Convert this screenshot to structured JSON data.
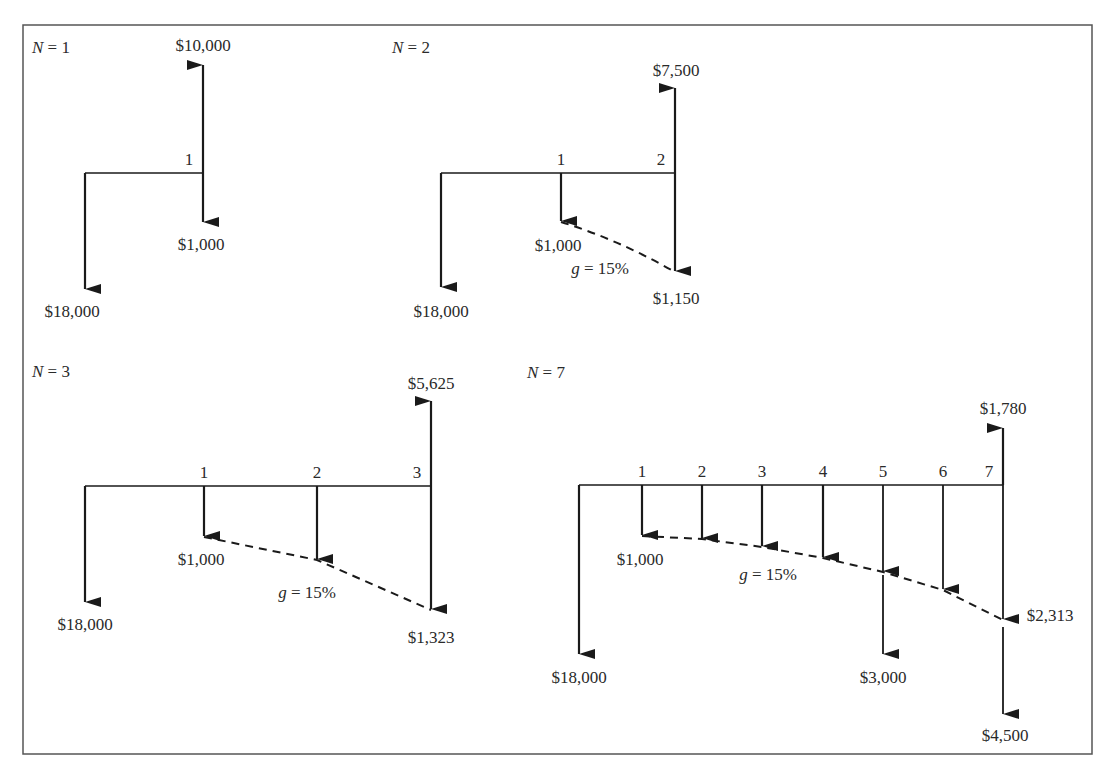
{
  "figure": {
    "frame": {
      "x": 23,
      "y": 25,
      "width": 1069,
      "height": 729
    },
    "colors": {
      "line": "#1a1a1a",
      "text": "#2a2a2a",
      "frame": "#555555",
      "background": "#ffffff"
    },
    "panels": [
      {
        "id": "n1",
        "title_var": "N",
        "title_rest": " = 1",
        "title_pos": [
          32,
          53
        ],
        "timeline_y": 173,
        "start_x": 85,
        "period_x": [
          203
        ],
        "period_labels": [
          "1"
        ],
        "initial_outflow": {
          "label": "$18,000",
          "tip_y": 290,
          "label_pos": [
            72,
            317
          ]
        },
        "outflows": [
          {
            "period": 1,
            "label": "$1,000",
            "tip_y": 223,
            "label_pos": [
              201,
              250
            ]
          }
        ],
        "inflows": [
          {
            "period": 1,
            "label": "$10,000",
            "tip_y": 64,
            "label_pos": [
              203,
              51
            ]
          }
        ],
        "extra_outflows": [],
        "growth": null
      },
      {
        "id": "n2",
        "title_var": "N",
        "title_rest": " = 2",
        "title_pos": [
          392,
          53
        ],
        "timeline_y": 173,
        "start_x": 441,
        "period_x": [
          561,
          675
        ],
        "period_labels": [
          "1",
          "2"
        ],
        "initial_outflow": {
          "label": "$18,000",
          "tip_y": 288,
          "label_pos": [
            441,
            317
          ]
        },
        "outflows": [
          {
            "period": 1,
            "label": "$1,000",
            "tip_y": 222,
            "label_pos": [
              558,
              251
            ]
          },
          {
            "period": 2,
            "label": "$1,150",
            "tip_y": 272,
            "label_pos": [
              676,
              304
            ]
          }
        ],
        "inflows": [
          {
            "period": 2,
            "label": "$7,500",
            "tip_y": 87,
            "label_pos": [
              676,
              76
            ]
          }
        ],
        "extra_outflows": [],
        "growth": {
          "var": "g",
          "rest": " = 15%",
          "label_pos": [
            600,
            274
          ]
        }
      },
      {
        "id": "n3",
        "title_var": "N",
        "title_rest": " = 3",
        "title_pos": [
          32,
          377
        ],
        "timeline_y": 486,
        "start_x": 85,
        "period_x": [
          204,
          317,
          431
        ],
        "period_labels": [
          "1",
          "2",
          "3"
        ],
        "initial_outflow": {
          "label": "$18,000",
          "tip_y": 603,
          "label_pos": [
            85,
            630
          ]
        },
        "outflows": [
          {
            "period": 1,
            "label": "$1,000",
            "tip_y": 537,
            "label_pos": [
              201,
              565
            ]
          },
          {
            "period": 2,
            "label": "",
            "tip_y": 560,
            "label_pos": [
              0,
              0
            ]
          },
          {
            "period": 3,
            "label": "$1,323",
            "tip_y": 610,
            "label_pos": [
              431,
              643
            ]
          }
        ],
        "inflows": [
          {
            "period": 3,
            "label": "$5,625",
            "tip_y": 400,
            "label_pos": [
              431,
              389
            ]
          }
        ],
        "extra_outflows": [],
        "growth": {
          "var": "g",
          "rest": " = 15%",
          "label_pos": [
            307,
            598
          ]
        }
      },
      {
        "id": "n7",
        "title_var": "N",
        "title_rest": " = 7",
        "title_pos": [
          527,
          378
        ],
        "timeline_y": 485,
        "start_x": 579,
        "period_x": [
          642,
          702,
          762,
          823,
          883,
          943,
          1003
        ],
        "period_labels": [
          "1",
          "2",
          "3",
          "4",
          "5",
          "6",
          "7"
        ],
        "initial_outflow": {
          "label": "$18,000",
          "tip_y": 655,
          "label_pos": [
            579,
            683
          ]
        },
        "outflows": [
          {
            "period": 1,
            "label": "$1,000",
            "tip_y": 536,
            "label_pos": [
              640,
              565
            ]
          },
          {
            "period": 2,
            "label": "",
            "tip_y": 539,
            "label_pos": [
              0,
              0
            ]
          },
          {
            "period": 3,
            "label": "",
            "tip_y": 547,
            "label_pos": [
              0,
              0
            ]
          },
          {
            "period": 4,
            "label": "",
            "tip_y": 558,
            "label_pos": [
              0,
              0
            ]
          },
          {
            "period": 5,
            "label": "",
            "tip_y": 572,
            "label_pos": [
              0,
              0
            ]
          },
          {
            "period": 6,
            "label": "",
            "tip_y": 590,
            "label_pos": [
              0,
              0
            ]
          },
          {
            "period": 7,
            "label": "$2,313",
            "tip_y": 620,
            "label_pos": [
              1050,
              621
            ]
          }
        ],
        "inflows": [
          {
            "period": 7,
            "label": "$1,780",
            "tip_y": 427,
            "label_pos": [
              1003,
              414
            ]
          }
        ],
        "extra_outflows": [
          {
            "period": 5,
            "label": "$3,000",
            "start_y": 575,
            "tip_y": 655,
            "label_pos": [
              883,
              683
            ]
          },
          {
            "period": 7,
            "label": "$4,500",
            "start_y": 627,
            "tip_y": 715,
            "label_pos": [
              1005,
              741
            ]
          }
        ],
        "growth": {
          "var": "g",
          "rest": " = 15%",
          "label_pos": [
            768,
            580
          ]
        }
      }
    ]
  }
}
